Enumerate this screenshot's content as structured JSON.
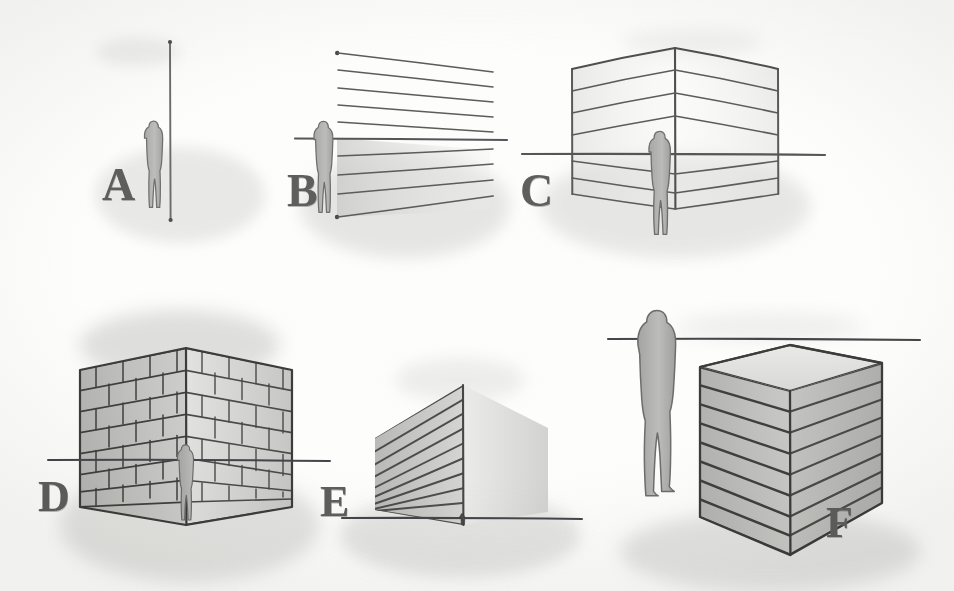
{
  "plate": {
    "title": "Perspective studies: horizon line and eye level",
    "medium": "graphite pencil drawing on white paper",
    "background_color": "#fdfdfc",
    "ink_color": "#4a4a48",
    "figure_fill": "#b4b4b2",
    "figure_stroke": "#6e6e6c",
    "shadow_color": "#cfcfcd"
  },
  "panels": [
    {
      "id": "A",
      "label": "A",
      "caption": "Vertical measuring line crossing the horizon at eye level with a standing figure",
      "has_horizon_line": true,
      "horizon_position": "at figure head height",
      "view": "eye level",
      "elements": [
        "vertical-measure-line",
        "horizon-line",
        "human-figure"
      ],
      "band_count": 0,
      "faces_visible": 0
    },
    {
      "id": "B",
      "label": "B",
      "caption": "Single wall plane in one-point perspective, courses converging to a vanishing point on the horizon",
      "has_horizon_line": true,
      "horizon_position": "at figure head height",
      "view": "eye level",
      "elements": [
        "wall-plane",
        "converging-courses",
        "horizon-line",
        "human-figure"
      ],
      "band_count": 10,
      "faces_visible": 1
    },
    {
      "id": "C",
      "label": "C",
      "caption": "Two-point perspective box with near vertical corner, banded courses, figure at the corner",
      "has_horizon_line": true,
      "horizon_position": "at figure head height, through the middle of the box",
      "view": "eye level",
      "elements": [
        "box-two-point",
        "near-corner",
        "banded-courses",
        "horizon-line",
        "human-figure"
      ],
      "band_count": 9,
      "faces_visible": 2
    },
    {
      "id": "D",
      "label": "D",
      "caption": "Masonry cube in two-point perspective with staggered block coursing, figure at the corner",
      "has_horizon_line": true,
      "horizon_position": "at figure head height, through the lower third of the cube",
      "view": "eye level",
      "elements": [
        "masonry-cube",
        "brick-coursing",
        "horizon-line",
        "human-figure"
      ],
      "band_count": 8,
      "faces_visible": 2
    },
    {
      "id": "E",
      "label": "E",
      "caption": "Tall block seen from below, worm's eye view, horizon at ground level with a tiny figure",
      "has_horizon_line": true,
      "horizon_position": "at ground level, at the base of the block",
      "view": "worm's eye / looking up",
      "elements": [
        "tall-block",
        "banded-courses",
        "horizon-line",
        "tiny-human-figure"
      ],
      "band_count": 10,
      "faces_visible": 2
    },
    {
      "id": "F",
      "label": "F",
      "caption": "Block seen from above, bird's eye view, horizon above the block with the top face visible and a large figure",
      "has_horizon_line": true,
      "horizon_position": "above the block, at the tall figure's head height",
      "view": "bird's eye / looking down",
      "elements": [
        "block-with-top-face",
        "banded-courses",
        "horizon-line",
        "human-figure"
      ],
      "band_count": 8,
      "faces_visible": 3
    }
  ]
}
